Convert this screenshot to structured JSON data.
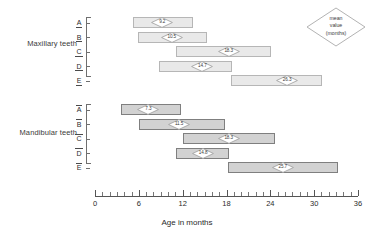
{
  "chart_data": {
    "type": "bar",
    "subtype": "floating-range-bar",
    "title": "",
    "xlabel": "Age in months",
    "ylabel": "",
    "xlim": [
      0,
      36
    ],
    "xticks": [
      0,
      6,
      12,
      18,
      24,
      30,
      36
    ],
    "xtick_labels": [
      "0",
      "6",
      "12",
      "18",
      "24",
      "30",
      "36"
    ],
    "minor_tick_step": 1,
    "grid": false,
    "legend": {
      "position": "top-right",
      "marker": "diamond",
      "lines": [
        "mean",
        "value",
        "(months)"
      ],
      "text": "mean value (months)"
    },
    "groups": [
      {
        "name": "Maxillary teeth",
        "label": "Maxillary teeth",
        "bar_style": "light",
        "fill": "#e9e9e9",
        "stroke": "#b6b6b6",
        "rows": [
          {
            "tooth": "A",
            "start": 5.2,
            "end": 13.4,
            "mean": 9.2,
            "mean_label": "9.2"
          },
          {
            "tooth": "B",
            "start": 5.9,
            "end": 15.3,
            "mean": 10.5,
            "mean_label": "10.5"
          },
          {
            "tooth": "C",
            "start": 11.1,
            "end": 24.1,
            "mean": 18.3,
            "mean_label": "18.3"
          },
          {
            "tooth": "D",
            "start": 8.8,
            "end": 18.8,
            "mean": 14.7,
            "mean_label": "14.7"
          },
          {
            "tooth": "E",
            "start": 18.6,
            "end": 31.1,
            "mean": 26.3,
            "mean_label": "26.3"
          }
        ]
      },
      {
        "name": "Mandibular teeth",
        "label": "Mandibular teeth",
        "bar_style": "dark",
        "fill": "#d2d2d2",
        "stroke": "#7f7f7f",
        "rows": [
          {
            "tooth": "A",
            "start": 3.6,
            "end": 11.8,
            "mean": 7.3,
            "mean_label": "7.3"
          },
          {
            "tooth": "B",
            "start": 6.0,
            "end": 17.8,
            "mean": 11.5,
            "mean_label": "11.5"
          },
          {
            "tooth": "C",
            "start": 12.0,
            "end": 24.6,
            "mean": 18.3,
            "mean_label": "18.3"
          },
          {
            "tooth": "D",
            "start": 11.1,
            "end": 18.4,
            "mean": 14.8,
            "mean_label": "14.8"
          },
          {
            "tooth": "E",
            "start": 18.2,
            "end": 33.2,
            "mean": 25.7,
            "mean_label": "25.7"
          }
        ]
      }
    ],
    "colors": {
      "maxillary_fill": "#e9e9e9",
      "maxillary_stroke": "#b6b6b6",
      "mandibular_fill": "#d2d2d2",
      "mandibular_stroke": "#7f7f7f",
      "axis": "#555555",
      "text": "#2b2b2b",
      "marker_stroke": "#9a9a9a",
      "marker_fill": "#ffffff"
    }
  }
}
